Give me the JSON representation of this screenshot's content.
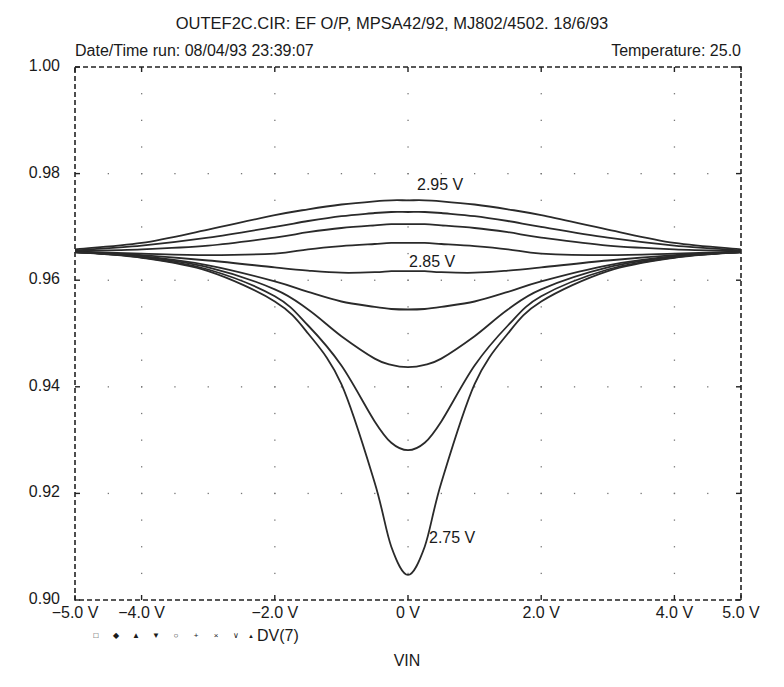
{
  "header": {
    "title": "OUTEF2C.CIR: EF O/P, MPSA42/92, MJ802/4502. 18/6/93",
    "datetime": "Date/Time  run: 08/04/93  23:39:07",
    "temperature": "Temperature: 25.0"
  },
  "legend": {
    "markers": [
      "□",
      "◆",
      "▲",
      "▼",
      "○",
      "+",
      "×",
      "∨",
      "▲"
    ],
    "label": "DV(7)"
  },
  "chart_data": {
    "type": "line",
    "title": "OUTEF2C.CIR: EF O/P, MPSA42/92, MJ802/4502. 18/6/93",
    "xlabel": "VIN",
    "ylabel": "DV(7)",
    "xlim": [
      -5.0,
      5.0
    ],
    "ylim": [
      0.9,
      1.0
    ],
    "x_ticks": [
      -5.0,
      -4.0,
      -2.0,
      0,
      2.0,
      4.0,
      5.0
    ],
    "x_tick_labels": [
      "−5.0 V",
      "−4.0 V",
      "−2.0 V",
      "0 V",
      "2.0 V",
      "4.0 V",
      "5.0 V"
    ],
    "y_ticks": [
      0.9,
      0.92,
      0.94,
      0.96,
      0.98,
      1.0
    ],
    "y_tick_labels": [
      "0.90",
      "0.92",
      "0.94",
      "0.96",
      "0.98",
      "1.00"
    ],
    "grid": "dotted",
    "frame": "dashed",
    "annotations": [
      {
        "text": "2.95 V",
        "x": 0.3,
        "y": 0.9762
      },
      {
        "text": "2.85 V",
        "x": 0.0,
        "y": 0.9628
      },
      {
        "text": "2.75 V",
        "x": 0.35,
        "y": 0.9105
      }
    ],
    "x": [
      -5.0,
      -4.0,
      -3.0,
      -2.0,
      -1.5,
      -1.0,
      -0.5,
      -0.25,
      0.0,
      0.25,
      0.5,
      1.0,
      1.5,
      2.0,
      3.0,
      4.0,
      5.0
    ],
    "series": [
      {
        "name": "2.95 V",
        "values": [
          0.9658,
          0.967,
          0.9695,
          0.9722,
          0.9733,
          0.9742,
          0.9748,
          0.975,
          0.975,
          0.975,
          0.9748,
          0.9742,
          0.9733,
          0.9722,
          0.9695,
          0.967,
          0.9658
        ]
      },
      {
        "name": "2.925 V",
        "values": [
          0.9656,
          0.9665,
          0.968,
          0.97,
          0.9711,
          0.972,
          0.9726,
          0.9728,
          0.9728,
          0.9728,
          0.9726,
          0.972,
          0.9711,
          0.97,
          0.968,
          0.9665,
          0.9656
        ]
      },
      {
        "name": "2.90 V",
        "values": [
          0.9655,
          0.9658,
          0.9665,
          0.968,
          0.969,
          0.9698,
          0.9703,
          0.9705,
          0.9705,
          0.9705,
          0.9703,
          0.9698,
          0.969,
          0.968,
          0.9665,
          0.9658,
          0.9655
        ]
      },
      {
        "name": "2.875 V",
        "values": [
          0.9654,
          0.965,
          0.9647,
          0.965,
          0.9658,
          0.9664,
          0.9668,
          0.967,
          0.967,
          0.967,
          0.9668,
          0.9664,
          0.9658,
          0.965,
          0.9647,
          0.965,
          0.9654
        ]
      },
      {
        "name": "2.85 V",
        "values": [
          0.9653,
          0.9647,
          0.9637,
          0.9624,
          0.9618,
          0.9614,
          0.9615,
          0.9617,
          0.9617,
          0.9617,
          0.9615,
          0.9614,
          0.9618,
          0.9624,
          0.9637,
          0.9647,
          0.9653
        ]
      },
      {
        "name": "2.825 V",
        "values": [
          0.9653,
          0.9645,
          0.9628,
          0.9598,
          0.9578,
          0.956,
          0.955,
          0.9546,
          0.9545,
          0.9546,
          0.955,
          0.956,
          0.9578,
          0.9598,
          0.9628,
          0.9645,
          0.9653
        ]
      },
      {
        "name": "2.80 V",
        "values": [
          0.9653,
          0.9644,
          0.9624,
          0.9583,
          0.9545,
          0.9495,
          0.9453,
          0.9441,
          0.9437,
          0.9441,
          0.9453,
          0.9495,
          0.9545,
          0.9583,
          0.9624,
          0.9644,
          0.9653
        ]
      },
      {
        "name": "2.775 V",
        "values": [
          0.9653,
          0.9643,
          0.962,
          0.957,
          0.9515,
          0.944,
          0.9335,
          0.9295,
          0.9281,
          0.9295,
          0.9335,
          0.944,
          0.9515,
          0.957,
          0.962,
          0.9643,
          0.9653
        ]
      },
      {
        "name": "2.75 V",
        "values": [
          0.9653,
          0.9642,
          0.9617,
          0.956,
          0.95,
          0.9405,
          0.922,
          0.91,
          0.9047,
          0.91,
          0.922,
          0.9405,
          0.95,
          0.956,
          0.9617,
          0.9642,
          0.9653
        ]
      }
    ]
  }
}
